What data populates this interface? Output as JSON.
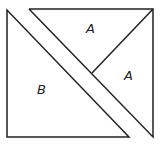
{
  "diagram": {
    "line_color": "#222222",
    "background": "#ffffff",
    "pieces": [
      {
        "name": "triangle-B",
        "label": "B",
        "points": "7,10 7,137 129,137"
      },
      {
        "name": "triangle-A-top",
        "label": "A",
        "points": "29,9 153,9 92,73"
      },
      {
        "name": "triangle-A-right",
        "label": "A",
        "points": "153,9 153,137 92,73"
      }
    ],
    "labels": [
      {
        "text": "A",
        "x": 86,
        "y": 33
      },
      {
        "text": "A",
        "x": 124,
        "y": 80
      },
      {
        "text": "B",
        "x": 37,
        "y": 94
      }
    ]
  }
}
